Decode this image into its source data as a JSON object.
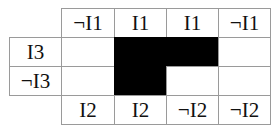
{
  "diagram": {
    "type": "karnaugh-map",
    "column_headers_top": [
      "¬I1",
      "I1",
      "I1",
      "¬I1"
    ],
    "column_headers_bottom": [
      "I2",
      "I2",
      "¬I2",
      "¬I2"
    ],
    "row_headers": [
      "I3",
      "¬I3"
    ],
    "cells": [
      [
        0,
        1,
        1,
        0
      ],
      [
        0,
        1,
        0,
        0
      ]
    ],
    "colors": {
      "filled": "#000000",
      "empty": "#ffffff",
      "grid": "#9a9a9a"
    }
  }
}
